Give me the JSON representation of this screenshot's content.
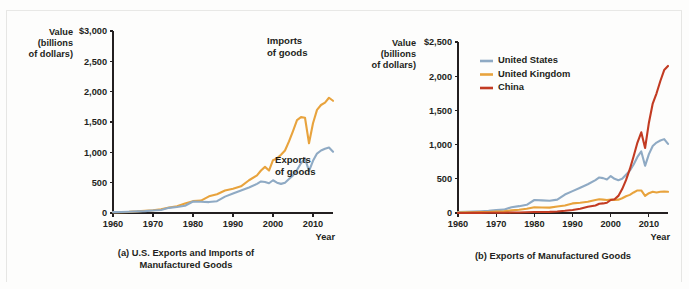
{
  "figure": {
    "panel_a_caption_line1": "(a) U.S. Exports and Imports of",
    "panel_a_caption_line2": "Manufactured Goods",
    "panel_b_caption": "(b) Exports of Manufactured Goods"
  },
  "chart_data": [
    {
      "id": "panel-a",
      "type": "line",
      "title": "(a) U.S. Exports and Imports of Manufactured Goods",
      "xlabel": "Year",
      "ylabel": "Value (billions of dollars)",
      "ylabel_lines": [
        "Value",
        "(billions",
        "of dollars)"
      ],
      "xlim": [
        1960,
        2015
      ],
      "ylim": [
        0,
        3000
      ],
      "yticks": [
        0,
        500,
        1000,
        1500,
        2000,
        2500,
        3000
      ],
      "ytick_labels": [
        "0",
        "500",
        "1,000",
        "1,500",
        "2,000",
        "2,500",
        "$3,000"
      ],
      "xticks": [
        1960,
        1970,
        1980,
        1990,
        2000,
        2010
      ],
      "xtick_labels": [
        "1960",
        "1970",
        "1980",
        "1990",
        "2000",
        "2010"
      ],
      "grid": false,
      "legend": "annotations",
      "annotations": [
        {
          "name": "imports-of-goods",
          "text_line1": "Imports",
          "text_line2": "of goods",
          "x": 1998.5,
          "y": 2780
        },
        {
          "name": "exports-of-goods",
          "text_line1": "Exports",
          "text_line2": "of goods",
          "x": 2000.5,
          "y": 820
        }
      ],
      "series": [
        {
          "name": "Imports of goods",
          "color": "#E8A33D",
          "x": [
            1960,
            1962,
            1964,
            1966,
            1968,
            1970,
            1972,
            1974,
            1976,
            1978,
            1980,
            1982,
            1984,
            1986,
            1988,
            1990,
            1992,
            1994,
            1996,
            1997,
            1998,
            1999,
            2000,
            2001,
            2002,
            2003,
            2004,
            2005,
            2006,
            2007,
            2008,
            2009,
            2010,
            2011,
            2012,
            2013,
            2014,
            2015
          ],
          "values": [
            12,
            15,
            19,
            27,
            38,
            45,
            63,
            90,
            110,
            155,
            195,
            205,
            275,
            310,
            370,
            400,
            440,
            540,
            620,
            700,
            760,
            700,
            870,
            900,
            960,
            1030,
            1180,
            1350,
            1530,
            1580,
            1570,
            1150,
            1480,
            1700,
            1780,
            1820,
            1900,
            1850
          ]
        },
        {
          "name": "Exports of goods",
          "color": "#8FAAC4",
          "x": [
            1960,
            1962,
            1964,
            1966,
            1968,
            1970,
            1972,
            1974,
            1976,
            1978,
            1980,
            1982,
            1984,
            1986,
            1988,
            1990,
            1992,
            1994,
            1996,
            1997,
            1998,
            1999,
            2000,
            2001,
            2002,
            2003,
            2004,
            2005,
            2006,
            2007,
            2008,
            2009,
            2010,
            2011,
            2012,
            2013,
            2014,
            2015
          ],
          "values": [
            15,
            17,
            21,
            26,
            31,
            42,
            49,
            85,
            100,
            120,
            190,
            185,
            180,
            195,
            270,
            320,
            370,
            420,
            480,
            520,
            510,
            490,
            540,
            500,
            480,
            500,
            560,
            620,
            710,
            820,
            900,
            690,
            860,
            980,
            1030,
            1060,
            1080,
            1010
          ]
        }
      ]
    },
    {
      "id": "panel-b",
      "type": "line",
      "title": "(b) Exports of Manufactured Goods",
      "xlabel": "Year",
      "ylabel": "Value (billions of dollars)",
      "ylabel_lines": [
        "Value",
        "(billions",
        "of dollars)"
      ],
      "xlim": [
        1960,
        2015
      ],
      "ylim": [
        0,
        2500
      ],
      "yticks": [
        0,
        500,
        1000,
        1500,
        2000,
        2500
      ],
      "ytick_labels": [
        "0",
        "500",
        "1,000",
        "1,500",
        "2,000",
        "$2,500"
      ],
      "xticks": [
        1960,
        1970,
        1980,
        1990,
        2000,
        2010
      ],
      "xtick_labels": [
        "1960",
        "1970",
        "1980",
        "1990",
        "2000",
        "2010"
      ],
      "grid": false,
      "legend": {
        "position": "top-left",
        "entries": [
          "United States",
          "United Kingdom",
          "China"
        ]
      },
      "series": [
        {
          "name": "United States",
          "color": "#8FAAC4",
          "x": [
            1960,
            1962,
            1964,
            1966,
            1968,
            1970,
            1972,
            1974,
            1976,
            1978,
            1980,
            1982,
            1984,
            1986,
            1988,
            1990,
            1992,
            1994,
            1996,
            1997,
            1998,
            1999,
            2000,
            2001,
            2002,
            2003,
            2004,
            2005,
            2006,
            2007,
            2008,
            2009,
            2010,
            2011,
            2012,
            2013,
            2014,
            2015
          ],
          "values": [
            15,
            17,
            21,
            26,
            31,
            42,
            49,
            85,
            100,
            120,
            190,
            185,
            180,
            195,
            270,
            320,
            370,
            420,
            480,
            520,
            510,
            490,
            540,
            500,
            480,
            500,
            560,
            620,
            710,
            820,
            900,
            690,
            860,
            980,
            1030,
            1060,
            1080,
            1010
          ]
        },
        {
          "name": "United Kingdom",
          "color": "#E8A33D",
          "x": [
            1960,
            1962,
            1964,
            1966,
            1968,
            1970,
            1972,
            1974,
            1976,
            1978,
            1980,
            1982,
            1984,
            1986,
            1988,
            1990,
            1992,
            1994,
            1996,
            1997,
            1998,
            1999,
            2000,
            2001,
            2002,
            2003,
            2004,
            2005,
            2006,
            2007,
            2008,
            2009,
            2010,
            2011,
            2012,
            2013,
            2014,
            2015
          ],
          "values": [
            8,
            9,
            11,
            13,
            15,
            20,
            25,
            38,
            48,
            62,
            85,
            80,
            78,
            95,
            110,
            140,
            150,
            165,
            190,
            200,
            195,
            190,
            195,
            190,
            195,
            215,
            245,
            265,
            300,
            330,
            330,
            250,
            290,
            310,
            300,
            310,
            315,
            310
          ]
        },
        {
          "name": "China",
          "color": "#C23B22",
          "x": [
            1960,
            1962,
            1964,
            1966,
            1968,
            1970,
            1972,
            1974,
            1976,
            1978,
            1980,
            1982,
            1984,
            1986,
            1988,
            1990,
            1992,
            1994,
            1996,
            1997,
            1998,
            1999,
            2000,
            2001,
            2002,
            2003,
            2004,
            2005,
            2006,
            2007,
            2008,
            2009,
            2010,
            2011,
            2012,
            2013,
            2014,
            2015
          ],
          "values": [
            1,
            1,
            2,
            2,
            3,
            3,
            4,
            7,
            8,
            10,
            14,
            14,
            16,
            22,
            32,
            45,
            62,
            90,
            110,
            135,
            140,
            150,
            190,
            200,
            250,
            350,
            480,
            640,
            830,
            1030,
            1180,
            950,
            1320,
            1600,
            1750,
            1930,
            2090,
            2150
          ]
        }
      ]
    }
  ]
}
